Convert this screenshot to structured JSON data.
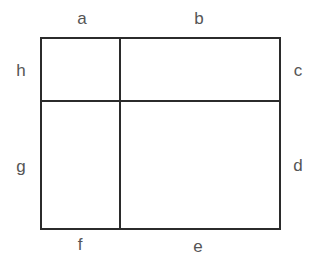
{
  "diagram": {
    "type": "partitioned-rectangle",
    "labels": {
      "top_left": "a",
      "top_right": "b",
      "right_top": "c",
      "right_bottom": "d",
      "bottom_right": "e",
      "bottom_left": "f",
      "left_bottom": "g",
      "left_top": "h"
    },
    "colors": {
      "line": "#2b2b2b",
      "label": "#555555",
      "background": "#ffffff"
    }
  }
}
